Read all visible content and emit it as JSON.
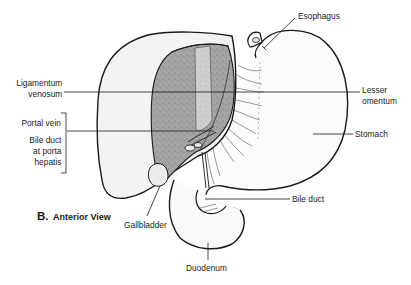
{
  "figure": {
    "panel_letter": "B.",
    "panel_title": "Anterior View"
  },
  "labels": {
    "esophagus": "Esophagus",
    "lig_venosum_1": "Ligamentum",
    "lig_venosum_2": "venosum",
    "lesser_omentum_1": "Lesser",
    "lesser_omentum_2": "omentum",
    "portal_vein": "Portal vein",
    "bile_duct_porta_1": "Bile duct",
    "bile_duct_porta_2": "at porta",
    "bile_duct_porta_3": "hepatis",
    "stomach": "Stomach",
    "bile_duct": "Bile duct",
    "gallbladder": "Gallbladder",
    "duodenum": "Duodenum"
  },
  "colors": {
    "line": "#1a1a1a",
    "liver_fill": "#f1f1f1",
    "cut_surface": "#9a9a9a",
    "lig_band": "#c4c4c4",
    "stomach_fill": "#fafafa"
  }
}
